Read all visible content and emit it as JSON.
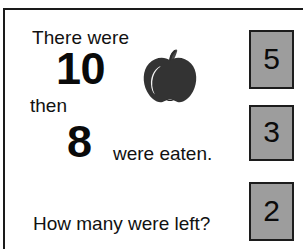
{
  "worksheet": {
    "problem": {
      "intro_text": "There were",
      "first_number": "10",
      "connector_text": "then",
      "second_number": "8",
      "action_text": "were eaten.",
      "question_text": "How many were left?"
    },
    "illustration": {
      "name": "apple-illustration",
      "body_color": "#333333",
      "stem_color": "#4a4a4a",
      "highlight_color": "#f2f2f2"
    },
    "answer_choices": [
      {
        "label": "5"
      },
      {
        "label": "3"
      },
      {
        "label": "2"
      }
    ],
    "colors": {
      "frame": "#1a1a1a",
      "choice_fill": "#9d9d9d",
      "choice_border": "#1c1c1c",
      "text": "#111111",
      "page_background": "#ffffff"
    }
  }
}
